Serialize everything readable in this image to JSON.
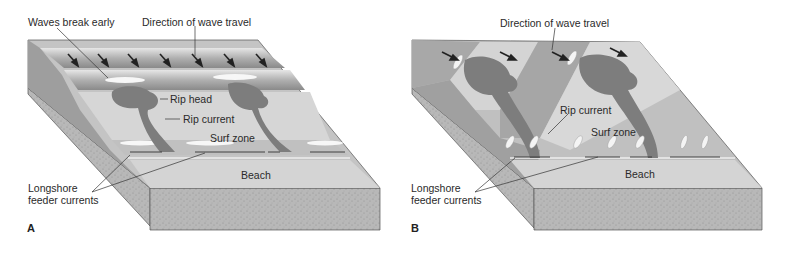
{
  "figure": {
    "panels": [
      {
        "id": "A",
        "letter": "A",
        "labels": {
          "waves_break_early": "Waves break early",
          "direction": "Direction of wave travel",
          "rip_head": "Rip head",
          "rip_current": "Rip current",
          "surf_zone": "Surf zone",
          "beach": "Beach",
          "longshore_1": "Longshore",
          "longshore_2": "feeder currents"
        }
      },
      {
        "id": "B",
        "letter": "B",
        "labels": {
          "direction": "Direction of wave travel",
          "rip_current": "Rip current",
          "surf_zone": "Surf zone",
          "beach": "Beach",
          "longshore_1": "Longshore",
          "longshore_2": "feeder currents"
        }
      }
    ],
    "colors": {
      "water_dark": "#8f8f8f",
      "water_light": "#c9c9c9",
      "rip": "#7a7a7a",
      "beach": "#d2d2d2",
      "sand_side": "#b5b5b5",
      "foam": "#f5f5f5",
      "outline": "#4a4a4a"
    }
  }
}
